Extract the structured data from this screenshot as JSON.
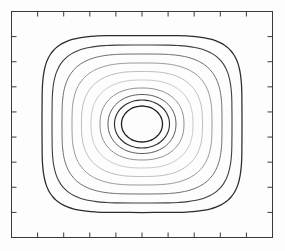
{
  "figure": {
    "width": 285,
    "height": 251,
    "background_color": "#fdfdfd",
    "title": "",
    "caption": ""
  },
  "axes": {
    "frame": {
      "x": 11.5,
      "y": 11.5,
      "width": 261,
      "height": 226
    },
    "frame_color": "#3a3a3a",
    "frame_line_width": 1.0,
    "tick_direction": "in",
    "tick_color": "#3a3a3a",
    "tick_length": 5,
    "tick_line_width": 1.0,
    "xticks_count": 9,
    "yticks_count": 8,
    "xtick_labels": [],
    "ytick_labels": [],
    "xlabel": "",
    "ylabel": "",
    "grid": false
  },
  "chart_data": {
    "type": "line",
    "subtype": "contour",
    "title": "",
    "xlabel": "",
    "ylabel": "",
    "grid": false,
    "legend": null,
    "xlim": [
      0,
      1
    ],
    "ylim": [
      0,
      1
    ],
    "center": {
      "x": 142,
      "y": 124
    },
    "n_levels": 10,
    "levels": [
      {
        "index": 1,
        "rx": 100,
        "ry": 88.5,
        "exponent": 4.6,
        "color": "#2b2b2b",
        "line_width": 1.25
      },
      {
        "index": 2,
        "rx": 90,
        "ry": 79,
        "exponent": 4.0,
        "color": "#3d3d3d",
        "line_width": 1.1
      },
      {
        "index": 3,
        "rx": 80,
        "ry": 70,
        "exponent": 3.4,
        "color": "#6e6e6e",
        "line_width": 1.0
      },
      {
        "index": 4,
        "rx": 70,
        "ry": 61,
        "exponent": 3.0,
        "color": "#9a9a9a",
        "line_width": 1.0
      },
      {
        "index": 5,
        "rx": 60.5,
        "ry": 52.5,
        "exponent": 2.7,
        "color": "#bdbdbd",
        "line_width": 1.0
      },
      {
        "index": 6,
        "rx": 51,
        "ry": 44,
        "exponent": 2.45,
        "color": "#c9c9c9",
        "line_width": 1.0
      },
      {
        "index": 7,
        "rx": 42,
        "ry": 36,
        "exponent": 2.25,
        "color": "#909090",
        "line_width": 1.0
      },
      {
        "index": 8,
        "rx": 34,
        "ry": 29.5,
        "exponent": 2.1,
        "color": "#5a5a5a",
        "line_width": 1.0
      },
      {
        "index": 9,
        "rx": 27.5,
        "ry": 24,
        "exponent": 2.02,
        "color": "#303030",
        "line_width": 1.15
      },
      {
        "index": 10,
        "rx": 20.5,
        "ry": 18,
        "exponent": 2.0,
        "color": "#1f1f1f",
        "line_width": 1.3
      }
    ]
  }
}
